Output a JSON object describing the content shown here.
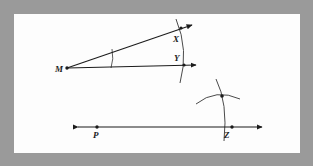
{
  "figure": {
    "frame": {
      "border_color": "#9a9a9a",
      "background_color": "#fdfdfd",
      "ink_color": "#1b1b1b"
    },
    "labels": {
      "m": "M",
      "x": "X",
      "y": "Y",
      "p": "P",
      "z": "Z"
    },
    "points": [
      {
        "name": "M",
        "label": "M",
        "x": 66,
        "y": 68
      },
      {
        "name": "X",
        "label": "X",
        "x": 180,
        "y": 29
      },
      {
        "name": "Y",
        "label": "Y",
        "x": 182,
        "y": 64
      },
      {
        "name": "P",
        "label": "P",
        "x": 97,
        "y": 126
      },
      {
        "name": "Z",
        "label": "Z",
        "x": 232,
        "y": 127
      },
      {
        "name": "arc-intersection",
        "label": "",
        "x": 222,
        "y": 96
      }
    ],
    "rays": [
      {
        "name": "ray-m-upper",
        "from": "M",
        "through": "X",
        "arrow_end": true
      },
      {
        "name": "ray-m-lower",
        "from": "M",
        "through": "Y",
        "arrow_end": true
      },
      {
        "name": "line-p-z",
        "from": "left-arrow",
        "through": "Z",
        "arrow_both": true
      }
    ],
    "arcs": [
      {
        "name": "angle-arc-at-m",
        "center": "M",
        "description": "small arc spanning angle at vertex M"
      },
      {
        "name": "arc-through-x-y",
        "center": "M",
        "description": "large arc crossing both rays at X and Y"
      },
      {
        "name": "arc-through-z",
        "center": "Z",
        "description": "arc centered at Z crossing the ray and rising above it"
      },
      {
        "name": "arc-crossing",
        "center": "arc-intersection",
        "description": "arc crossing the Z arc at the intersection point"
      }
    ]
  }
}
